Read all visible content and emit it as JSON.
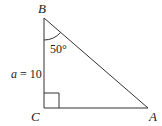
{
  "diagram": {
    "type": "right-triangle",
    "vertices": {
      "B": {
        "label": "B",
        "x": 44,
        "y": 18
      },
      "C": {
        "label": "C",
        "x": 44,
        "y": 108
      },
      "A": {
        "label": "A",
        "x": 148,
        "y": 108
      }
    },
    "side_label": {
      "variable": "a",
      "eq": " = 10"
    },
    "angle_label": "50°",
    "right_angle_at": "C",
    "stroke_color": "#333333"
  }
}
